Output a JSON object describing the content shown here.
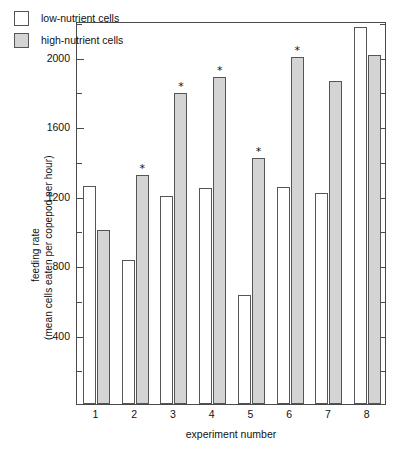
{
  "chart_data": {
    "type": "bar",
    "title": "",
    "xlabel": "experiment number",
    "ylabel_line1": "feeding rate",
    "ylabel_line2": "(mean cells eaten per copepod per hour)",
    "categories": [
      "1",
      "2",
      "3",
      "4",
      "5",
      "6",
      "7",
      "8"
    ],
    "series": [
      {
        "name": "low-nutrient cells",
        "color": "#ffffff",
        "values": [
          1255,
          830,
          1200,
          1245,
          625,
          1250,
          1215,
          2170
        ]
      },
      {
        "name": "high-nutrient cells",
        "color": "#d4d4d4",
        "values": [
          1000,
          1320,
          1790,
          1880,
          1415,
          1995,
          1860,
          2010
        ]
      }
    ],
    "significance_markers": {
      "symbol": "*",
      "series": "high-nutrient cells",
      "categories": [
        "2",
        "3",
        "4",
        "5",
        "6"
      ]
    },
    "ylim": [
      0,
      2205
    ],
    "ytick_major": [
      400,
      800,
      1200,
      1600,
      2000
    ],
    "ytick_major_labels": [
      "400",
      "800",
      "1200",
      "1600",
      "2000"
    ],
    "ytick_minor": [
      200,
      600,
      1000,
      1400,
      1800,
      2200
    ],
    "grid": false,
    "legend_position": "top-left"
  },
  "legend": {
    "items": [
      {
        "label": "low-nutrient cells"
      },
      {
        "label": "high-nutrient cells"
      }
    ]
  }
}
